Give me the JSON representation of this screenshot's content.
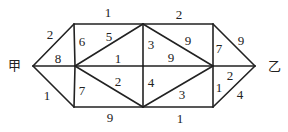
{
  "diagram": {
    "type": "weighted-graph",
    "nodes": [
      {
        "id": "jia",
        "label": "甲",
        "x": 33,
        "y": 66,
        "lx": 14,
        "ly": 66
      },
      {
        "id": "A",
        "label": "",
        "x": 74,
        "y": 24
      },
      {
        "id": "B",
        "label": "",
        "x": 75,
        "y": 66
      },
      {
        "id": "C",
        "label": "",
        "x": 74,
        "y": 107
      },
      {
        "id": "D",
        "label": "",
        "x": 143,
        "y": 24
      },
      {
        "id": "E",
        "label": "",
        "x": 143,
        "y": 66
      },
      {
        "id": "F",
        "label": "",
        "x": 143,
        "y": 107
      },
      {
        "id": "G",
        "label": "",
        "x": 213,
        "y": 24
      },
      {
        "id": "H",
        "label": "",
        "x": 213,
        "y": 66
      },
      {
        "id": "I",
        "label": "",
        "x": 213,
        "y": 107
      },
      {
        "id": "yi",
        "label": "乙",
        "x": 255,
        "y": 66,
        "lx": 274,
        "ly": 67
      }
    ],
    "edges": [
      {
        "from": "jia",
        "to": "A",
        "weight": "2",
        "lx": 50,
        "ly": 36
      },
      {
        "from": "jia",
        "to": "B",
        "weight": "8",
        "lx": 58,
        "ly": 60
      },
      {
        "from": "jia",
        "to": "C",
        "weight": "1",
        "lx": 47,
        "ly": 97
      },
      {
        "from": "A",
        "to": "D",
        "weight": "1",
        "lx": 108,
        "ly": 14
      },
      {
        "from": "D",
        "to": "G",
        "weight": "2",
        "lx": 179,
        "ly": 16
      },
      {
        "from": "C",
        "to": "F",
        "weight": "9",
        "lx": 110,
        "ly": 119
      },
      {
        "from": "F",
        "to": "I",
        "weight": "1",
        "lx": 180,
        "ly": 120
      },
      {
        "from": "A",
        "to": "B",
        "weight": "6",
        "lx": 82,
        "ly": 43
      },
      {
        "from": "B",
        "to": "C",
        "weight": "7",
        "lx": 82,
        "ly": 92
      },
      {
        "from": "B",
        "to": "D",
        "weight": "5",
        "lx": 109,
        "ly": 38
      },
      {
        "from": "B",
        "to": "E",
        "weight": "1",
        "lx": 118,
        "ly": 60
      },
      {
        "from": "B",
        "to": "F",
        "weight": "2",
        "lx": 118,
        "ly": 83
      },
      {
        "from": "D",
        "to": "E",
        "weight": "3",
        "lx": 151,
        "ly": 46
      },
      {
        "from": "E",
        "to": "F",
        "weight": "4",
        "lx": 151,
        "ly": 84
      },
      {
        "from": "D",
        "to": "H",
        "weight": "9",
        "lx": 188,
        "ly": 42
      },
      {
        "from": "E",
        "to": "H",
        "weight": "9",
        "lx": 171,
        "ly": 59
      },
      {
        "from": "F",
        "to": "H",
        "weight": "3",
        "lx": 182,
        "ly": 96
      },
      {
        "from": "G",
        "to": "H",
        "weight": "7",
        "lx": 219,
        "ly": 50
      },
      {
        "from": "H",
        "to": "I",
        "weight": "1",
        "lx": 219,
        "ly": 89
      },
      {
        "from": "G",
        "to": "yi",
        "weight": "9",
        "lx": 241,
        "ly": 42
      },
      {
        "from": "H",
        "to": "yi",
        "weight": "2",
        "lx": 230,
        "ly": 77
      },
      {
        "from": "I",
        "to": "yi",
        "weight": "4",
        "lx": 240,
        "ly": 96
      }
    ]
  }
}
